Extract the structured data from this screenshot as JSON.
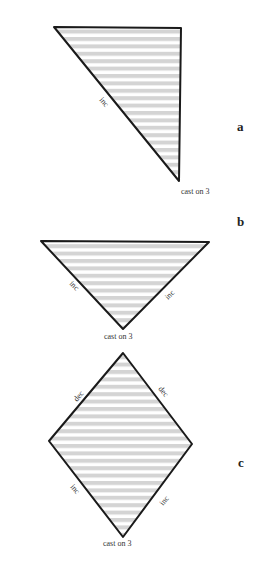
{
  "figures": [
    {
      "id": "a",
      "letter": "a",
      "edge_labels": [
        "inc"
      ],
      "bottom_label": "cast on 3"
    },
    {
      "id": "b",
      "letter": "b",
      "edge_labels": [
        "inc",
        "inc"
      ],
      "bottom_label": "cast on 3"
    },
    {
      "id": "c",
      "letter": "c",
      "edge_labels": [
        "dec",
        "dec",
        "inc",
        "inc"
      ],
      "bottom_label": "cast on 3"
    }
  ],
  "colors": {
    "stroke": "#1a1a1a",
    "stripe": "#d4d4d4",
    "background": "#ffffff"
  }
}
